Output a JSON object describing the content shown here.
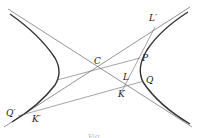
{
  "diagram": {
    "type": "hyperbola-construction",
    "colors": {
      "curve": "#333333",
      "line": "#666666",
      "label": "#222222"
    },
    "labels": {
      "C": "C",
      "P": "P",
      "Q": "Q",
      "L": "L",
      "K": "K",
      "L_prime": "L′",
      "Q_prime": "Q′",
      "K_prime": "K′"
    },
    "caption": "Fig."
  }
}
